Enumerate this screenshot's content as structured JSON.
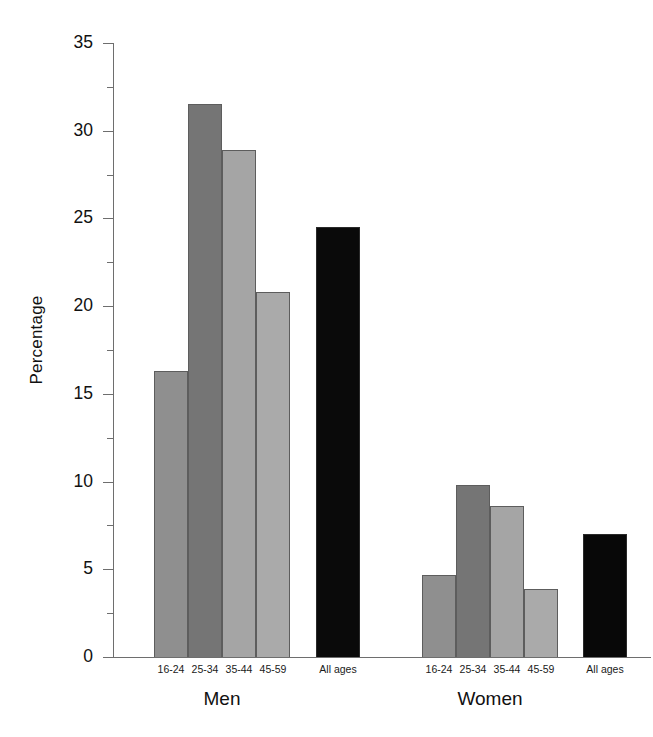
{
  "chart_data": {
    "type": "bar",
    "title": "",
    "xlabel": "",
    "ylabel": "Percentage",
    "ylim": [
      0,
      35
    ],
    "ytick_step": 5,
    "yminor_step": 2.5,
    "grid": false,
    "legend": "none",
    "ytick_labels": [
      "35",
      "30",
      "25",
      "20",
      "15",
      "10",
      "5",
      "0"
    ],
    "ytick_values": [
      35,
      30,
      25,
      20,
      15,
      10,
      5,
      0
    ],
    "groups": [
      {
        "name": "Men",
        "categories": [
          "16-24",
          "25-34",
          "35-44",
          "45-59"
        ],
        "values": [
          16.3,
          31.5,
          28.9,
          20.8
        ],
        "colors": [
          "#8f8f8f",
          "#757575",
          "#a5a5a5",
          "#aaaaaa"
        ],
        "summary": {
          "label": "All ages",
          "value": 24.5,
          "color": "#0a0a0a"
        }
      },
      {
        "name": "Women",
        "categories": [
          "16-24",
          "25-34",
          "35-44",
          "45-59"
        ],
        "values": [
          4.7,
          9.8,
          8.6,
          3.9
        ],
        "colors": [
          "#8f8f8f",
          "#757575",
          "#a5a5a5",
          "#aaaaaa"
        ],
        "summary": {
          "label": "All ages",
          "value": 7.0,
          "color": "#080808"
        }
      }
    ]
  },
  "axis": {
    "y_title": "Percentage"
  }
}
